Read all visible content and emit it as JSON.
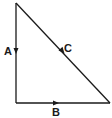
{
  "diagram": {
    "type": "vector-triangle",
    "stroke_color": "#1a1a1a",
    "vertices": {
      "top": [
        16,
        3
      ],
      "bottom_left": [
        16,
        103
      ],
      "bottom_right": [
        110,
        103
      ]
    },
    "vectors": [
      {
        "label": "A",
        "edge": "left-vertical",
        "direction": "down"
      },
      {
        "label": "B",
        "edge": "bottom-horizontal",
        "direction": "right"
      },
      {
        "label": "C",
        "edge": "hypotenuse",
        "direction": "down-right"
      }
    ]
  }
}
